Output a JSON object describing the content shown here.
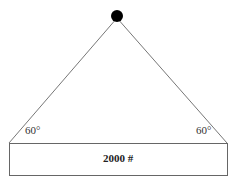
{
  "diagram": {
    "left_angle": "60°",
    "right_angle": "60°",
    "load_label": "2000 #",
    "colors": {
      "line": "#777777",
      "pivot": "#000000",
      "box_border": "#666666"
    }
  }
}
